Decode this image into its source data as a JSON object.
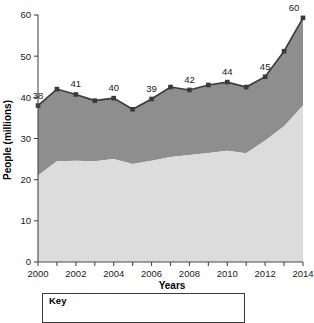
{
  "chart_data": {
    "type": "area",
    "title": "",
    "xlabel": "Years",
    "ylabel": "People (millions)",
    "xlim": [
      2000,
      2014
    ],
    "ylim": [
      0,
      60
    ],
    "yticks": [
      0,
      10,
      20,
      30,
      40,
      50,
      60
    ],
    "xticks": [
      2000,
      2001,
      2002,
      2003,
      2004,
      2005,
      2006,
      2007,
      2008,
      2009,
      2010,
      2011,
      2012,
      2013,
      2014
    ],
    "xtick_labels_shown": [
      2000,
      2002,
      2004,
      2006,
      2008,
      2010,
      2012,
      2014
    ],
    "grid": false,
    "legend_position": "below-axis",
    "stacked": true,
    "categories": [
      2000,
      2001,
      2002,
      2003,
      2004,
      2005,
      2006,
      2007,
      2008,
      2009,
      2010,
      2011,
      2012,
      2013,
      2014
    ],
    "series": [
      {
        "name": "lower-band",
        "color": "#dcdcdc",
        "values": [
          21.0,
          24.5,
          24.6,
          24.5,
          25.0,
          23.8,
          24.6,
          25.5,
          26.0,
          26.5,
          27.0,
          26.4,
          29.5,
          33.0,
          38.0
        ]
      },
      {
        "name": "upper-band",
        "color": "#8e8e8e",
        "values": [
          17.0,
          17.5,
          16.1,
          14.7,
          14.8,
          13.3,
          15.0,
          17.0,
          15.9,
          16.5,
          17.0,
          16.1,
          15.5,
          18.2,
          21.3
        ]
      }
    ],
    "total_line": {
      "name": "total",
      "color": "#3a3a3a",
      "marker": "square",
      "values": [
        38.0,
        42.0,
        40.7,
        39.2,
        39.8,
        37.1,
        39.6,
        42.5,
        41.8,
        43.0,
        43.7,
        42.5,
        45.0,
        51.2,
        59.3
      ]
    },
    "point_labels": [
      {
        "x": 2000,
        "text": "38"
      },
      {
        "x": 2002,
        "text": "41"
      },
      {
        "x": 2004,
        "text": "40"
      },
      {
        "x": 2006,
        "text": "39"
      },
      {
        "x": 2008,
        "text": "42"
      },
      {
        "x": 2010,
        "text": "44"
      },
      {
        "x": 2012,
        "text": "45"
      },
      {
        "x": 2014,
        "text": "60"
      }
    ]
  },
  "axes": {
    "y_title": "People (millions)",
    "x_title": "Years",
    "y_tick_labels": [
      "0",
      "10",
      "20",
      "30",
      "40",
      "50",
      "60"
    ],
    "x_tick_labels": [
      "2000",
      "2002",
      "2004",
      "2006",
      "2008",
      "2010",
      "2012",
      "2014"
    ]
  },
  "legend": {
    "title": "Key"
  },
  "colors": {
    "lower_band": "#dcdcdc",
    "upper_band": "#8e8e8e",
    "line": "#3a3a3a",
    "axis": "#4a4a4a",
    "text": "#1a1a1a",
    "background": "#ffffff"
  }
}
